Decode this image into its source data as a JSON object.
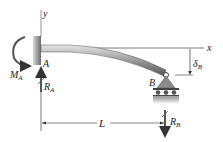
{
  "diagram": {
    "labels": {
      "y_axis": "y",
      "x_axis": "x",
      "point_a": "A",
      "point_b": "B",
      "moment_a": "M",
      "moment_a_sub": "A",
      "reaction_a": "R",
      "reaction_a_sub": "A",
      "reaction_b": "R",
      "reaction_b_sub": "B",
      "deflection": "δ",
      "deflection_sub": "B",
      "length": "L"
    },
    "colors": {
      "line": "#333333",
      "beam_dark": "#555555",
      "beam_light": "#bbbbbb",
      "wall": "#9a9a9a",
      "support": "#8a8a8a",
      "ground": "#c8c8c8"
    }
  }
}
